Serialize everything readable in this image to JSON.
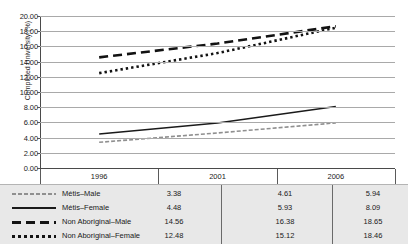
{
  "figure": {
    "cropped_title_fragment": "·        ·              ·          ·"
  },
  "chart_data": {
    "type": "line",
    "title": "",
    "xlabel": "",
    "ylabel": "Completed University (%)",
    "categories": [
      "1996",
      "2001",
      "2006"
    ],
    "ylim": [
      0.0,
      20.0
    ],
    "ytick_step": 2.0,
    "ytick_labels": [
      "20.00",
      "18.00",
      "16.00",
      "14.00",
      "12.00",
      "10.00",
      "8.00",
      "6.00",
      "4.00",
      "2.00",
      "0.00"
    ],
    "grid": true,
    "legend_position": "bottom-table",
    "series": [
      {
        "name": "Métis–Male",
        "style": "fine-dash",
        "color": "#8f8f8f",
        "values": [
          3.38,
          4.61,
          5.94
        ],
        "value_labels": [
          "3.38",
          "4.61",
          "5.94"
        ]
      },
      {
        "name": "Métis–Female",
        "style": "solid",
        "color": "#1a1a1a",
        "values": [
          4.48,
          5.93,
          8.09
        ],
        "value_labels": [
          "4.48",
          "5.93",
          "8.09"
        ]
      },
      {
        "name": "Non Aboriginal–Male",
        "style": "long-dash",
        "color": "#121212",
        "values": [
          14.56,
          16.38,
          18.65
        ],
        "value_labels": [
          "14.56",
          "16.38",
          "18.65"
        ]
      },
      {
        "name": "Non Aboriginal–Female",
        "style": "dotted",
        "color": "#121212",
        "values": [
          12.48,
          15.12,
          18.46
        ],
        "value_labels": [
          "12.48",
          "15.12",
          "18.46"
        ]
      }
    ]
  }
}
